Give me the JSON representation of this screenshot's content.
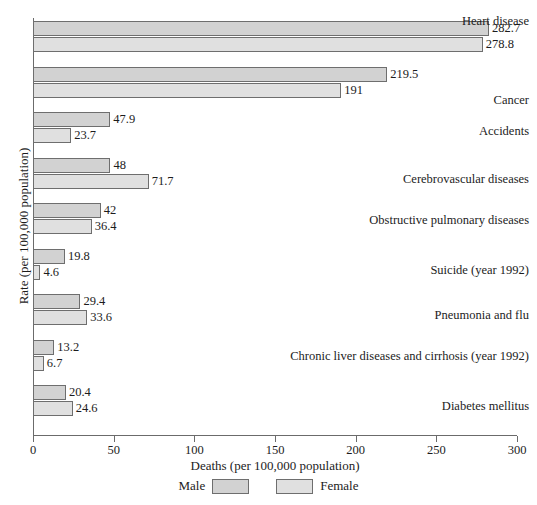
{
  "chart_data": {
    "type": "bar",
    "orientation": "horizontal",
    "title": "",
    "xlabel": "Deaths (per 100,000 population)",
    "ylabel": "Rate (per 100,000 population)",
    "xlim": [
      0,
      300
    ],
    "xticks": [
      0,
      50,
      100,
      150,
      200,
      250,
      300
    ],
    "xtick_labels": [
      "0",
      "50",
      "100",
      "150",
      "200",
      "250",
      "300"
    ],
    "grid": false,
    "legend_position": "bottom",
    "categories": [
      "Heart disease",
      "Cancer",
      "Accidents",
      "Cerebrovascular diseases",
      "Obstructive pulmonary diseases",
      "Suicide (year 1992)",
      "Pneumonia and flu",
      "Chronic liver diseases and cirrhosis (year 1992)",
      "Diabetes mellitus"
    ],
    "series": [
      {
        "name": "Male",
        "color": "#d2d2d2",
        "values": [
          282.7,
          219.5,
          47.9,
          48,
          42,
          19.8,
          29.4,
          13.2,
          20.4
        ],
        "value_labels": [
          "282.7",
          "219.5",
          "47.9",
          "48",
          "42",
          "19.8",
          "29.4",
          "13.2",
          "20.4"
        ]
      },
      {
        "name": "Female",
        "color": "#e0e0e0",
        "values": [
          278.8,
          191,
          23.7,
          71.7,
          36.4,
          4.6,
          33.6,
          6.7,
          24.6
        ],
        "value_labels": [
          "278.8",
          "191",
          "23.7",
          "71.7",
          "36.4",
          "4.6",
          "33.6",
          "6.7",
          "24.6"
        ]
      }
    ]
  },
  "legend": {
    "male_label": "Male",
    "female_label": "Female"
  },
  "colors": {
    "male": "#d2d2d2",
    "female": "#e0e0e0",
    "axis": "#6b6b6b",
    "text": "#1c1c1c",
    "background": "#ffffff"
  }
}
